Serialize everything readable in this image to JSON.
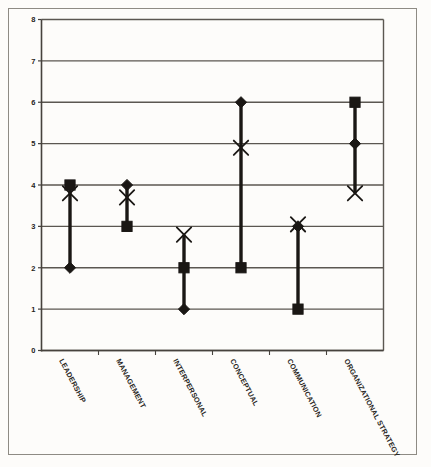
{
  "chart_data": {
    "type": "scatter",
    "title": "",
    "xlabel": "",
    "ylabel": "",
    "ylim": [
      0,
      8
    ],
    "yticks": [
      "0",
      "1",
      "2",
      "3",
      "4",
      "5",
      "6",
      "7",
      "8"
    ],
    "grid": true,
    "legend": "none",
    "categories": [
      "LEADERSHIP",
      "MANAGEMENT",
      "INTERPERSONAL",
      "CONCEPTUAL",
      "COMMUNICATION",
      "ORGANIZATIONAL STRATEGY"
    ],
    "series": [
      {
        "name": "diamond",
        "marker": "diamond",
        "values": [
          2,
          4,
          1,
          6,
          3,
          5
        ]
      },
      {
        "name": "square",
        "marker": "square",
        "values": [
          4,
          3,
          2,
          2,
          1,
          6
        ]
      },
      {
        "name": "cross",
        "marker": "x",
        "values": [
          3.8,
          3.7,
          2.8,
          4.9,
          3.05,
          3.8
        ]
      }
    ],
    "range_bars": [
      {
        "category": "LEADERSHIP",
        "low": 2,
        "high": 4
      },
      {
        "category": "MANAGEMENT",
        "low": 3,
        "high": 4
      },
      {
        "category": "INTERPERSONAL",
        "low": 1,
        "high": 2.8
      },
      {
        "category": "CONCEPTUAL",
        "low": 2,
        "high": 6
      },
      {
        "category": "COMMUNICATION",
        "low": 1,
        "high": 3
      },
      {
        "category": "ORGANIZATIONAL STRATEGY",
        "low": 3.8,
        "high": 6
      }
    ],
    "colors": {
      "marker": "#1a1714",
      "line": "#1a1714",
      "grid": "#5b5751",
      "axis": "#46423d",
      "background": "#fdfcfa",
      "frame": "#8e8b84"
    }
  }
}
